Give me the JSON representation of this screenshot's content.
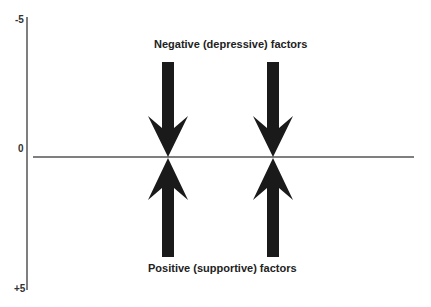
{
  "diagram": {
    "axis": {
      "ticks": [
        {
          "label": "-5",
          "value": -5
        },
        {
          "label": "0",
          "value": 0
        },
        {
          "label": "+5",
          "value": 5
        }
      ]
    },
    "top_label": "Negative (depressive) factors",
    "bottom_label": "Positive (supportive) factors",
    "arrows": [
      {
        "direction": "down",
        "group": "negative",
        "position": 1
      },
      {
        "direction": "down",
        "group": "negative",
        "position": 2
      },
      {
        "direction": "up",
        "group": "positive",
        "position": 1
      },
      {
        "direction": "up",
        "group": "positive",
        "position": 2
      }
    ],
    "colors": {
      "arrow": "#1a1a1a",
      "line": "#555555"
    }
  }
}
